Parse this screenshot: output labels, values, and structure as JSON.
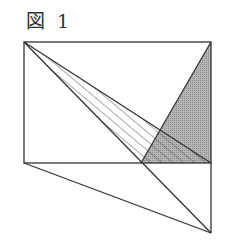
{
  "figure": {
    "caption": "図 1"
  },
  "diagram": {
    "points": {
      "A_top_left": [
        24,
        42
      ],
      "B_top_right": [
        211,
        42
      ],
      "C_bottom_right": [
        211,
        163
      ],
      "D_bottom_left": [
        24,
        163
      ],
      "E_bottom_mid": [
        141,
        163
      ],
      "F_intersection": [
        160,
        130
      ],
      "G_below": [
        211,
        233
      ]
    },
    "colors": {
      "stroke": "#333333",
      "gray_fill": "#a8a8a8",
      "hatch": "#555555"
    }
  }
}
